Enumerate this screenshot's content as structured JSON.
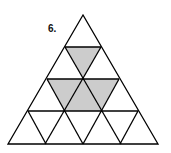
{
  "problem": {
    "number_label": "6."
  },
  "figure": {
    "rows": 4,
    "fill_color": "#cccccc",
    "stroke_color": "#000000",
    "shaded_cells": [
      {
        "row": 2,
        "type": "inverted",
        "index": 1
      },
      {
        "row": 3,
        "type": "inverted",
        "index": 1
      },
      {
        "row": 3,
        "type": "upright",
        "index": 2
      },
      {
        "row": 3,
        "type": "inverted",
        "index": 2
      }
    ]
  }
}
